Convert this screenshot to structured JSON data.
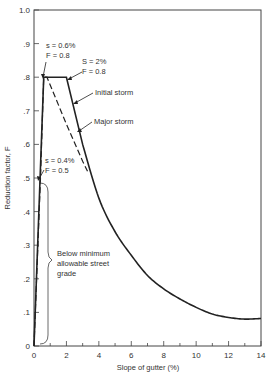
{
  "chart_data": {
    "type": "line",
    "title": "",
    "xlabel": "Slope of gutter (%)",
    "ylabel": "Reduction factor, F",
    "xlim": [
      0,
      14
    ],
    "ylim": [
      0,
      1.0
    ],
    "grid": false,
    "legend": "none (curves labelled by leader-line annotations)",
    "x_ticks": [
      "0",
      "2",
      "4",
      "6",
      "8",
      "10",
      "12",
      "14"
    ],
    "y_ticks": [
      "0",
      ".1",
      ".2",
      ".3",
      ".4",
      ".5",
      ".6",
      ".7",
      ".8",
      ".9",
      "1.0"
    ],
    "series": [
      {
        "name": "Initial storm",
        "style": "solid",
        "x": [
          0,
          0.6,
          2.0,
          3.0,
          4.0,
          5.0,
          6.0,
          7.0,
          8.0,
          9.0,
          10.0,
          11.0,
          12.0,
          13.0,
          14.0
        ],
        "y": [
          0,
          0.8,
          0.8,
          0.6,
          0.44,
          0.34,
          0.27,
          0.21,
          0.17,
          0.14,
          0.115,
          0.095,
          0.085,
          0.08,
          0.082
        ]
      },
      {
        "name": "Major storm",
        "style": "dashed",
        "x": [
          0,
          0.4,
          0.6,
          0.8,
          2.0,
          3.0,
          3.3
        ],
        "y": [
          0,
          0.5,
          0.8,
          0.8,
          0.66,
          0.55,
          0.52
        ]
      }
    ],
    "annotations": [
      {
        "text": [
          "s = 0.6%",
          "F = 0.8"
        ],
        "points_to": [
          0.6,
          0.8
        ]
      },
      {
        "text": [
          "S = 2%",
          "F = 0.8"
        ],
        "points_to": [
          2.0,
          0.8
        ]
      },
      {
        "text": [
          "Initial storm"
        ],
        "points_to": [
          2.6,
          0.69
        ]
      },
      {
        "text": [
          "Major storm"
        ],
        "points_to": [
          2.7,
          0.61
        ]
      },
      {
        "text": [
          "s = 0.4%",
          "F = 0.5"
        ],
        "points_to": [
          0.4,
          0.5
        ]
      },
      {
        "text": [
          "Below minimum",
          "allowable street",
          "grade"
        ],
        "brace_range_y": [
          0,
          0.5
        ]
      }
    ]
  },
  "labels": {
    "xlabel": "Slope of gutter (%)",
    "ylabel": "Reduction factor, F",
    "ann_s06_l1": "s = 0.6%",
    "ann_s06_l2": "F = 0.8",
    "ann_s2_l1": "S = 2%",
    "ann_s2_l2": "F = 0.8",
    "ann_initial": "Initial storm",
    "ann_major": "Major storm",
    "ann_s04_l1": "s = 0.4%",
    "ann_s04_l2": "F = 0.5",
    "ann_below_l1": "Below minimum",
    "ann_below_l2": "allowable street",
    "ann_below_l3": "grade"
  }
}
